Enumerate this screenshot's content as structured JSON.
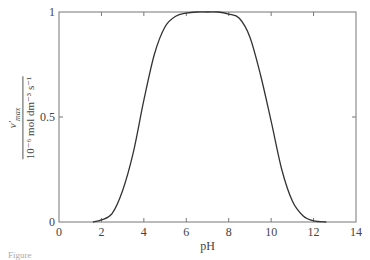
{
  "chart_data": {
    "type": "line",
    "title": "",
    "xlabel": "pH",
    "ylabel": "v′max / (10⁻⁶ mol dm⁻³ s⁻¹)",
    "ylabel_parts": {
      "numerator": "v′",
      "numerator_sub": "max",
      "denominator": "10⁻⁶ mol dm⁻³ s⁻¹"
    },
    "xlim": [
      0,
      14
    ],
    "ylim": [
      0,
      1
    ],
    "x_ticks": [
      0,
      2,
      4,
      6,
      8,
      10,
      12,
      14
    ],
    "x_tick_labels": [
      "0",
      "2",
      "4",
      "6",
      "8",
      "10",
      "12",
      "14"
    ],
    "y_ticks": [
      0,
      0.5,
      1
    ],
    "y_tick_labels": [
      "0",
      "0.5",
      "1"
    ],
    "grid": false,
    "legend": null,
    "series": [
      {
        "name": "v′max",
        "color": "#333333",
        "x": [
          1.6,
          2.0,
          2.5,
          3.0,
          3.5,
          4.0,
          4.5,
          5.0,
          5.5,
          6.0,
          6.5,
          7.0,
          7.5,
          8.0,
          8.5,
          9.0,
          9.5,
          10.0,
          10.5,
          11.0,
          11.5,
          12.0,
          12.6
        ],
        "values": [
          0.0,
          0.01,
          0.04,
          0.15,
          0.33,
          0.58,
          0.8,
          0.93,
          0.98,
          0.995,
          1.0,
          1.0,
          1.0,
          0.99,
          0.97,
          0.88,
          0.7,
          0.48,
          0.25,
          0.1,
          0.03,
          0.005,
          0.0
        ]
      }
    ]
  },
  "caption": "Figure"
}
